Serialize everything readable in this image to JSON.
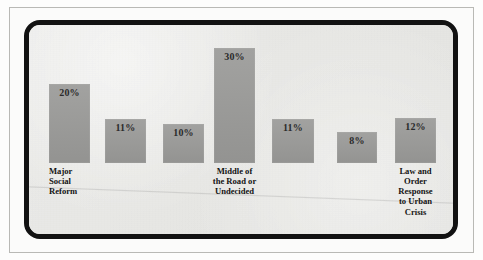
{
  "chart_data": {
    "type": "bar",
    "title": "",
    "subtitle": "",
    "xlabel": "",
    "ylabel": "",
    "ylim": [
      0,
      30
    ],
    "grid": false,
    "legend": null,
    "value_suffix": "%",
    "categories": [
      "Major\nSocial\nReform",
      "",
      "",
      "Middle of\nthe Road or\nUndecided",
      "",
      "",
      "Law and\nOrder\nResponse\nto Urban\nCrisis"
    ],
    "values": [
      20,
      11,
      10,
      30,
      11,
      8,
      12
    ],
    "data_labels": [
      "20%",
      "11%",
      "10%",
      "30%",
      "11%",
      "8%",
      "12%"
    ],
    "bar_color": "#9b9b99",
    "background_color": "#e9e9e6",
    "frame_color": "#121212",
    "text_color": "#141414",
    "bars": [
      {
        "value": 20,
        "label": "20%",
        "category": "Major\nSocial\nReform",
        "x": 49,
        "width": 41,
        "top": 84,
        "bottom": 163,
        "label_align": "left"
      },
      {
        "value": 11,
        "label": "11%",
        "category": "",
        "x": 105,
        "width": 41,
        "top": 119,
        "bottom": 163,
        "label_align": "center"
      },
      {
        "value": 10,
        "label": "10%",
        "category": "",
        "x": 163,
        "width": 41,
        "top": 124,
        "bottom": 163,
        "label_align": "center"
      },
      {
        "value": 30,
        "label": "30%",
        "category": "Middle of\nthe Road or\nUndecided",
        "x": 214,
        "width": 41,
        "top": 48,
        "bottom": 163,
        "label_align": "center"
      },
      {
        "value": 11,
        "label": "11%",
        "category": "",
        "x": 272,
        "width": 42,
        "top": 119,
        "bottom": 163,
        "label_align": "center"
      },
      {
        "value": 8,
        "label": "8%",
        "category": "",
        "x": 337,
        "width": 40,
        "top": 132,
        "bottom": 163,
        "label_align": "center"
      },
      {
        "value": 12,
        "label": "12%",
        "category": "Law and\nOrder\nResponse\nto Urban\nCrisis",
        "x": 395,
        "width": 41,
        "top": 118,
        "bottom": 163,
        "label_align": "center"
      }
    ]
  }
}
